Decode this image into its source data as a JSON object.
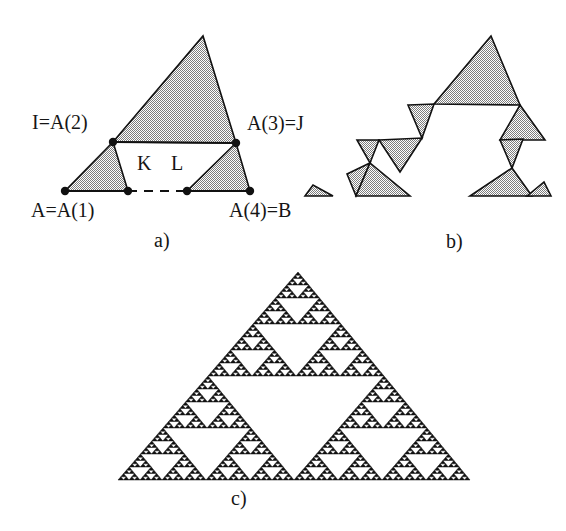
{
  "figure": {
    "caption_id": "fractal-iteration-figure",
    "background_color": "#ffffff",
    "fill_color": "#9a9a9a",
    "fill_color_dark": "#111111",
    "stroke_color": "#111111"
  },
  "panels": [
    {
      "id": "a",
      "label": "a)",
      "label_x": 154,
      "label_y": 230,
      "description": "Initiator and generator: large shaded triangle on segment IJ with two smaller shaded triangles on AK and LB",
      "labels": [
        {
          "name": "label-I-A2",
          "text": "I=A(2)",
          "x": 32,
          "y": 112,
          "anchor": "start"
        },
        {
          "name": "label-A3-J",
          "text": "A(3)=J",
          "x": 247,
          "y": 113,
          "anchor": "start"
        },
        {
          "name": "label-A-A1",
          "text": "A=A(1)",
          "x": 31,
          "y": 200,
          "anchor": "start"
        },
        {
          "name": "label-A4-B",
          "text": "A(4)=B",
          "x": 229,
          "y": 200,
          "anchor": "start"
        },
        {
          "name": "label-K",
          "text": "K",
          "x": 137,
          "y": 153,
          "anchor": "start"
        },
        {
          "name": "label-L",
          "text": "L",
          "x": 171,
          "y": 153,
          "anchor": "start"
        }
      ],
      "points": [
        {
          "name": "point-A",
          "x": 65,
          "y": 191
        },
        {
          "name": "point-K",
          "x": 128,
          "y": 191
        },
        {
          "name": "point-L",
          "x": 187,
          "y": 191
        },
        {
          "name": "point-B",
          "x": 250,
          "y": 191
        },
        {
          "name": "point-I",
          "x": 113,
          "y": 142
        },
        {
          "name": "point-J",
          "x": 236,
          "y": 143
        },
        {
          "name": "point-apex",
          "x": 203,
          "y": 36
        }
      ],
      "shapes": [
        {
          "name": "triangle-large-IJ",
          "points": "113,142 203,36 236,143"
        },
        {
          "name": "triangle-small-AK",
          "points": "65,191 128,191 113,142"
        },
        {
          "name": "triangle-small-LB",
          "points": "187,191 250,191 236,143"
        }
      ],
      "solid_segments": [
        {
          "name": "segment-AK",
          "x1": 65,
          "y1": 191,
          "x2": 128,
          "y2": 191
        },
        {
          "name": "segment-LB",
          "x1": 187,
          "y1": 191,
          "x2": 250,
          "y2": 191
        },
        {
          "name": "segment-IJ",
          "x1": 113,
          "y1": 142,
          "x2": 236,
          "y2": 143
        }
      ],
      "dashed_segments": [
        {
          "name": "segment-KL-dashed",
          "x1": 128,
          "y1": 191,
          "x2": 187,
          "y2": 191
        }
      ]
    },
    {
      "id": "b",
      "label": "b)",
      "label_x": 446,
      "label_y": 231,
      "description": "Second iteration: the generator applied to every edge of panel a",
      "shapes": [
        {
          "name": "tri-b-1",
          "points": "434,104 491,36 520,105"
        },
        {
          "name": "tri-b-2",
          "points": "408,105 434,104 422,138"
        },
        {
          "name": "tri-b-3",
          "points": "379,140 422,138 400,172"
        },
        {
          "name": "tri-b-4",
          "points": "357,140 379,140 370,163"
        },
        {
          "name": "tri-b-5",
          "points": "347,174 370,163 356,196"
        },
        {
          "name": "tri-b-6",
          "points": "410,196 356,196 370,163"
        },
        {
          "name": "tri-b-7",
          "points": "333,196 313,185 305,196"
        },
        {
          "name": "tri-b-8",
          "points": "520,105 545,140 500,140"
        },
        {
          "name": "tri-b-9",
          "points": "500,140 523,139 512,168"
        },
        {
          "name": "tri-b-10",
          "points": "512,168 532,196 470,196"
        },
        {
          "name": "tri-b-11",
          "points": "527,196 544,182 551,196"
        }
      ]
    },
    {
      "id": "c",
      "label": "c)",
      "label_x": 231,
      "label_y": 488,
      "description": "Limit fractal: Sierpinski-like gasket with jagged self-similar boundary",
      "iterations": 6,
      "base_triangle": {
        "apex_x": 298,
        "apex_y": 272,
        "left_x": 118,
        "left_y": 480,
        "right_x": 470,
        "right_y": 480
      }
    }
  ]
}
